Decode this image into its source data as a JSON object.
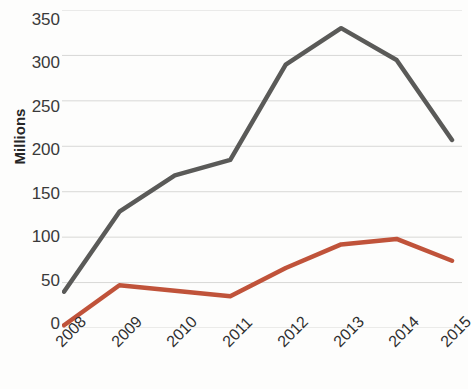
{
  "chart_data": {
    "type": "line",
    "title": "",
    "xlabel": "",
    "ylabel": "Millions",
    "categories": [
      "2008",
      "2009",
      "2010",
      "2011",
      "2012",
      "2013",
      "2014",
      "2015"
    ],
    "yticks": [
      0,
      50,
      100,
      150,
      200,
      250,
      300,
      350
    ],
    "ylim": [
      0,
      350
    ],
    "grid": true,
    "legend": "none",
    "series": [
      {
        "name": "series-1",
        "color": "#5a5a58",
        "values": [
          40,
          128,
          168,
          185,
          290,
          330,
          295,
          207
        ]
      },
      {
        "name": "series-2",
        "color": "#c0533a",
        "values": [
          3,
          47,
          41,
          35,
          66,
          92,
          98,
          74
        ]
      }
    ]
  },
  "axis": {
    "y_title": "Millions",
    "y_tick_labels": [
      "350",
      "300",
      "250",
      "200",
      "150",
      "100",
      "50",
      "0"
    ],
    "x_tick_labels": [
      "2008",
      "2009",
      "2010",
      "2011",
      "2012",
      "2013",
      "2014",
      "2015"
    ]
  }
}
